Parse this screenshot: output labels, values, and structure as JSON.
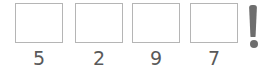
{
  "widget": {
    "name": "numeric-answer-slots",
    "background_color": "#ffffff"
  },
  "slots": {
    "count": 4,
    "box_border_color": "#b5b5b5",
    "box_fill_color": "#ffffff",
    "label_color": "#595959",
    "items": [
      {
        "label": "5",
        "value": "",
        "placeholder": ""
      },
      {
        "label": "2",
        "value": "",
        "placeholder": ""
      },
      {
        "label": "9",
        "value": "",
        "placeholder": ""
      },
      {
        "label": "7",
        "value": "",
        "placeholder": ""
      }
    ]
  },
  "indicator": {
    "icon": "exclamation-mark-icon",
    "glyph": "!",
    "color": "#6e6e6e"
  }
}
